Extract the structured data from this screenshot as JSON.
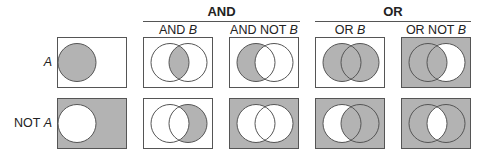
{
  "groups": [
    {
      "label": "AND"
    },
    {
      "label": "OR"
    }
  ],
  "columns": [
    {
      "prefix": "",
      "var": ""
    },
    {
      "prefix": "AND ",
      "var": "B"
    },
    {
      "prefix": "AND NOT ",
      "var": "B"
    },
    {
      "prefix": "OR ",
      "var": "B"
    },
    {
      "prefix": "OR NOT ",
      "var": "B"
    }
  ],
  "rows": [
    {
      "prefix": "",
      "var": "A"
    },
    {
      "prefix": "NOT ",
      "var": "A"
    }
  ],
  "colors": {
    "shade": "#b3b3b3",
    "outline": "#555555",
    "background": "#ffffff"
  }
}
